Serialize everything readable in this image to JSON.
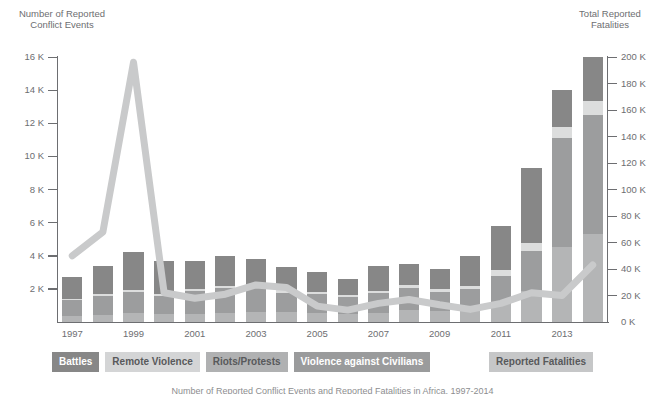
{
  "left_axis": {
    "title": "Number of Reported\nConflict Events",
    "ticks": [
      "16 K",
      "14 K",
      "12 K",
      "10 K",
      "8 K",
      "6 K",
      "4 K",
      "2 K"
    ]
  },
  "right_axis": {
    "title": "Total Reported\nFatalities",
    "ticks": [
      "200 K",
      "180 K",
      "160 K",
      "140 K",
      "120 K",
      "100 K",
      "80 K",
      "60 K",
      "40 K",
      "20 K",
      "0 K"
    ]
  },
  "legend": {
    "items": [
      {
        "label": "Battles",
        "color": "#878787"
      },
      {
        "label": "Remote Violence",
        "color": "#d4d5d6"
      },
      {
        "label": "Riots/Protests",
        "color": "#b0b1b2"
      },
      {
        "label": "Violence against Civilians",
        "color": "#9a9b9c"
      },
      {
        "label": "Reported Fatalities",
        "color": "#c6c7c8"
      }
    ]
  },
  "caption": "Number of Reported Conflict Events and Reported Fatalities in Africa, 1997-2014",
  "colors": {
    "battles": "#878787",
    "remote_violence": "#dcdddd",
    "riots_protests": "#b4b5b6",
    "violence_civilians": "#9c9d9e",
    "fatalities_line": "#c9cacb",
    "axis": "#6d6e71",
    "text": "#6d6e71",
    "background": "#ffffff"
  },
  "chart_data": {
    "type": "bar",
    "title": "Number of Reported Conflict Events and Reported Fatalities in Africa, 1997-2014",
    "xlabel": "",
    "ylabel": "Number of Reported Conflict Events",
    "y2label": "Total Reported Fatalities",
    "ylim": [
      0,
      16000
    ],
    "y2lim": [
      0,
      200000
    ],
    "ytick_values": [
      2000,
      4000,
      6000,
      8000,
      10000,
      12000,
      14000,
      16000
    ],
    "y2tick_values": [
      0,
      20000,
      40000,
      60000,
      80000,
      100000,
      120000,
      140000,
      160000,
      180000,
      200000
    ],
    "grid": false,
    "legend_position": "bottom",
    "categories": [
      1997,
      1998,
      1999,
      2000,
      2001,
      2002,
      2003,
      2004,
      2005,
      2006,
      2007,
      2008,
      2009,
      2010,
      2011,
      2012,
      2013,
      2014
    ],
    "xtick_labels": [
      "1997",
      "",
      "1999",
      "",
      "2001",
      "",
      "2003",
      "",
      "2005",
      "",
      "2007",
      "",
      "2009",
      "",
      "2011",
      "",
      "2013",
      ""
    ],
    "series": [
      {
        "name": "Riots/Protests",
        "stack_order": 1,
        "values": [
          380,
          430,
          520,
          470,
          500,
          560,
          600,
          580,
          520,
          480,
          560,
          700,
          640,
          700,
          1100,
          1900,
          4500,
          5300
        ]
      },
      {
        "name": "Violence against Civilians",
        "stack_order": 2,
        "values": [
          950,
          1150,
          1300,
          1100,
          1350,
          1500,
          1450,
          1200,
          1150,
          1050,
          1200,
          1350,
          1200,
          1300,
          1700,
          2400,
          6600,
          7200
        ]
      },
      {
        "name": "Remote Violence",
        "stack_order": 3,
        "values": [
          60,
          90,
          110,
          100,
          120,
          140,
          150,
          130,
          120,
          110,
          140,
          180,
          170,
          200,
          330,
          500,
          700,
          850
        ]
      },
      {
        "name": "Battles",
        "stack_order": 4,
        "values": [
          1310,
          1730,
          2270,
          2030,
          1730,
          1800,
          1600,
          1390,
          1210,
          960,
          1500,
          1270,
          1190,
          1800,
          2670,
          4500,
          2200,
          2650
        ]
      }
    ],
    "total_events": [
      2700,
      3400,
      4200,
      3700,
      3700,
      4000,
      3800,
      3300,
      3000,
      2600,
      3400,
      3500,
      3200,
      4000,
      5800,
      9300,
      14000,
      16000
    ],
    "fatalities_line": {
      "name": "Reported Fatalities",
      "values": [
        50000,
        68000,
        196000,
        22000,
        18000,
        21000,
        28000,
        26000,
        12000,
        9000,
        14000,
        17000,
        13000,
        9500,
        14000,
        22000,
        20000,
        43000
      ]
    }
  }
}
